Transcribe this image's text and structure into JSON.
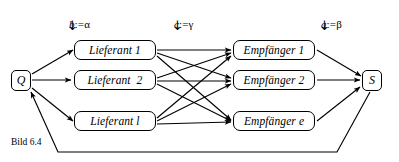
{
  "figure": {
    "caption": "Bild 6.4"
  },
  "params": [
    {
      "var": "b",
      "assign": ":=",
      "value": "α",
      "arrow": "↓"
    },
    {
      "var": "c",
      "assign": ":=",
      "value": "γ",
      "arrow": "↓"
    },
    {
      "var": "a",
      "assign": ":=",
      "value": "β",
      "arrow": "↓"
    }
  ],
  "nodes": {
    "source": {
      "label": "Q"
    },
    "sink": {
      "label": "S"
    },
    "suppliers": [
      {
        "label": "Lieferant 1"
      },
      {
        "label": "Lieferant  2"
      },
      {
        "label": "Lieferant l"
      }
    ],
    "receivers": [
      {
        "label": "Empfänger 1"
      },
      {
        "label": "Empfänger 2"
      },
      {
        "label": "Empfänger e"
      }
    ]
  },
  "colors": {
    "stroke": "#000000",
    "background": "#ffffff"
  }
}
